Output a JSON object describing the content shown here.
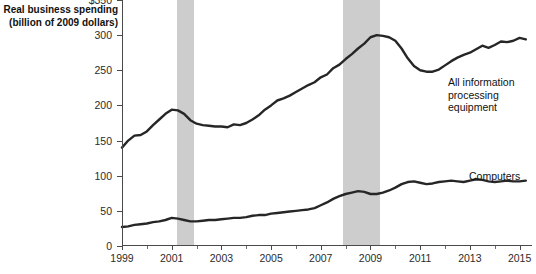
{
  "chart_data": {
    "type": "line",
    "title": "Real business spending\n(billion of 2009 dollars)",
    "xlabel": "",
    "ylabel": "Real business spending (billion of 2009 dollars)",
    "xlim": [
      1999,
      2015.5
    ],
    "ylim": [
      0,
      350
    ],
    "grid": false,
    "legend_position": "inline-annotation",
    "y_ticks": [
      0,
      50,
      100,
      150,
      200,
      250,
      300,
      350
    ],
    "y_tick_labels": [
      "0",
      "50",
      "100",
      "150",
      "200",
      "250",
      "300",
      "$350"
    ],
    "x_ticks": [
      1999,
      2001,
      2003,
      2005,
      2007,
      2009,
      2011,
      2013,
      2015
    ],
    "x_tick_labels": [
      "1999",
      "2001",
      "2003",
      "2005",
      "2007",
      "2009",
      "2011",
      "2013",
      "2015"
    ],
    "x_minor_ticks": [
      2000,
      2002,
      2004,
      2006,
      2008,
      2010,
      2012,
      2014
    ],
    "shaded_regions": [
      {
        "name": "recession-2001",
        "start": 2001.2,
        "end": 2001.9,
        "color": "#cdcdcd"
      },
      {
        "name": "recession-2008",
        "start": 2007.9,
        "end": 2009.4,
        "color": "#cdcdcd"
      }
    ],
    "series": [
      {
        "name": "All information processing equipment",
        "color": "#262626",
        "x": [
          1999.0,
          1999.25,
          1999.5,
          1999.75,
          2000.0,
          2000.25,
          2000.5,
          2000.75,
          2001.0,
          2001.25,
          2001.5,
          2001.75,
          2002.0,
          2002.25,
          2002.5,
          2002.75,
          2003.0,
          2003.25,
          2003.5,
          2003.75,
          2004.0,
          2004.25,
          2004.5,
          2004.75,
          2005.0,
          2005.25,
          2005.5,
          2005.75,
          2006.0,
          2006.25,
          2006.5,
          2006.75,
          2007.0,
          2007.25,
          2007.5,
          2007.75,
          2008.0,
          2008.25,
          2008.5,
          2008.75,
          2009.0,
          2009.25,
          2009.5,
          2009.75,
          2010.0,
          2010.25,
          2010.5,
          2010.75,
          2011.0,
          2011.25,
          2011.5,
          2011.75,
          2012.0,
          2012.25,
          2012.5,
          2012.75,
          2013.0,
          2013.25,
          2013.5,
          2013.75,
          2014.0,
          2014.25,
          2014.5,
          2014.75,
          2015.0,
          2015.25
        ],
        "values": [
          140,
          150,
          157,
          158,
          163,
          172,
          180,
          188,
          194,
          193,
          188,
          179,
          174,
          172,
          171,
          170,
          170,
          169,
          173,
          172,
          175,
          180,
          186,
          194,
          200,
          207,
          210,
          214,
          219,
          224,
          229,
          233,
          240,
          244,
          253,
          258,
          266,
          273,
          281,
          288,
          297,
          300,
          299,
          297,
          292,
          281,
          267,
          256,
          250,
          248,
          248,
          251,
          257,
          263,
          268,
          272,
          275,
          280,
          285,
          282,
          286,
          291,
          290,
          292,
          296,
          294
        ]
      },
      {
        "name": "All information processing equipment (continued)",
        "color": "#262626",
        "x": [
          2015.25
        ],
        "values": [
          294
        ]
      },
      {
        "name": "Computers",
        "color": "#262626",
        "x": [
          1999.0,
          1999.25,
          1999.5,
          1999.75,
          2000.0,
          2000.25,
          2000.5,
          2000.75,
          2001.0,
          2001.25,
          2001.5,
          2001.75,
          2002.0,
          2002.25,
          2002.5,
          2002.75,
          2003.0,
          2003.25,
          2003.5,
          2003.75,
          2004.0,
          2004.25,
          2004.5,
          2004.75,
          2005.0,
          2005.25,
          2005.5,
          2005.75,
          2006.0,
          2006.25,
          2006.5,
          2006.75,
          2007.0,
          2007.25,
          2007.5,
          2007.75,
          2008.0,
          2008.25,
          2008.5,
          2008.75,
          2009.0,
          2009.25,
          2009.5,
          2009.75,
          2010.0,
          2010.25,
          2010.5,
          2010.75,
          2011.0,
          2011.25,
          2011.5,
          2011.75,
          2012.0,
          2012.25,
          2012.5,
          2012.75,
          2013.0,
          2013.25,
          2013.5,
          2013.75,
          2014.0,
          2014.25,
          2014.5,
          2014.75,
          2015.0,
          2015.25
        ],
        "values": [
          27,
          28,
          30,
          31,
          32,
          34,
          35,
          37,
          40,
          39,
          37,
          35,
          35,
          36,
          37,
          37,
          38,
          39,
          40,
          40,
          41,
          43,
          44,
          44,
          46,
          47,
          48,
          49,
          50,
          51,
          52,
          54,
          58,
          62,
          67,
          71,
          74,
          76,
          78,
          77,
          74,
          74,
          76,
          79,
          83,
          88,
          91,
          92,
          90,
          88,
          89,
          91,
          92,
          93,
          92,
          91,
          93,
          95,
          94,
          92,
          91,
          92,
          93,
          92,
          92,
          93
        ]
      }
    ],
    "annotations": [
      {
        "name": "label-equipment",
        "text": "All information\nprocessing equipment"
      },
      {
        "name": "label-computers",
        "text": "Computers"
      }
    ]
  },
  "colors": {
    "line": "#262626",
    "axis": "#4a4a4a",
    "recession_band": "#cdcdcd",
    "text": "#2b2b2b",
    "background": "#ffffff"
  }
}
